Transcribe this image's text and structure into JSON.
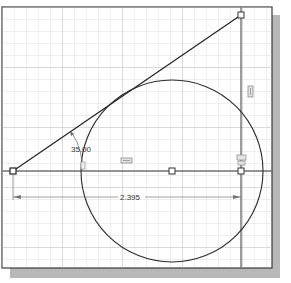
{
  "sketch": {
    "colors": {
      "background": "#ffffff",
      "grid": "#d4d4d4",
      "geometry": "#2a2a2a",
      "dimension": "#555555",
      "constraint": "#8a8a8a",
      "shadow": "#b5b5b5",
      "frame": "#3a3a3a"
    },
    "dimensions": {
      "angle_label": "35.00",
      "length_label": "2.395"
    },
    "constraints": [
      {
        "name": "vertical-constraint-icon",
        "glyph": "▯"
      },
      {
        "name": "horizontal-constraint-icon",
        "glyph": "▭"
      },
      {
        "name": "tangent-constraint-icon",
        "glyph": "⌒"
      },
      {
        "name": "coincident-constraint-icon",
        "glyph": "≡"
      }
    ],
    "points": [
      {
        "name": "left-endpoint",
        "x": 13,
        "y": 171
      },
      {
        "name": "circle-center-point",
        "x": 172,
        "y": 171
      },
      {
        "name": "right-endpoint",
        "x": 241,
        "y": 171
      },
      {
        "name": "top-endpoint",
        "x": 241,
        "y": 15
      }
    ]
  }
}
